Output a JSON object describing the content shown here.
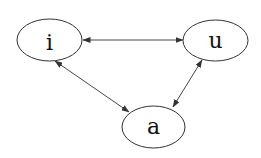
{
  "diagram": {
    "type": "undirected-graph-bidirectional",
    "nodes": [
      {
        "id": "i",
        "label": "i"
      },
      {
        "id": "u",
        "label": "u"
      },
      {
        "id": "a",
        "label": "a"
      }
    ],
    "edges": [
      {
        "from": "i",
        "to": "u",
        "arrows": "both"
      },
      {
        "from": "i",
        "to": "a",
        "arrows": "both"
      },
      {
        "from": "u",
        "to": "a",
        "arrows": "both"
      }
    ],
    "colors": {
      "stroke": "#333333",
      "background": "#ffffff"
    }
  }
}
